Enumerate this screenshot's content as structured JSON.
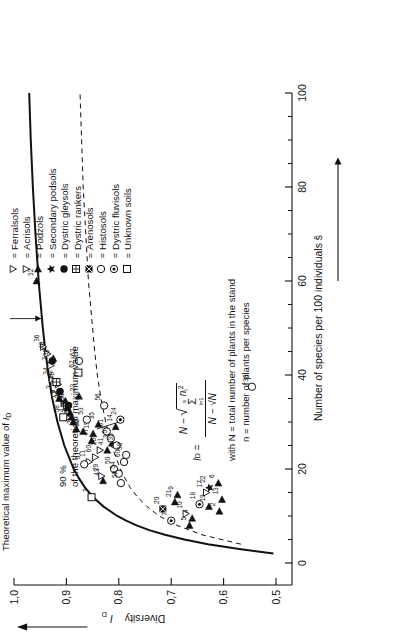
{
  "chart_data": {
    "type": "scatter",
    "title": "",
    "xlabel": "Number of species per 100 individuals  ŝ",
    "ylabel": "Diversity I_D",
    "xlim": [
      0,
      100
    ],
    "ylim": [
      0.5,
      1.0
    ],
    "x_ticks": [
      0,
      20,
      40,
      60,
      80,
      100
    ],
    "x_tick_labels": [
      "0",
      "20",
      "40",
      "60",
      "80",
      "100"
    ],
    "x_minor_ticks": [
      5,
      10,
      15,
      25,
      30,
      35,
      45,
      50,
      55,
      65,
      70,
      75,
      85,
      90,
      95
    ],
    "y_ticks": [
      0.5,
      0.6,
      0.7,
      0.8,
      0.9,
      1.0
    ],
    "y_tick_labels": [
      "0,5",
      "0,6",
      "0,7",
      "0,8",
      "0,9",
      "1,0"
    ],
    "grid": false,
    "legend_position": "right",
    "curves": [
      {
        "name": "Theoretical maximum value of ID",
        "style": "solid",
        "points": [
          [
            2,
            0.505
          ],
          [
            3,
            0.57
          ],
          [
            4,
            0.63
          ],
          [
            5,
            0.675
          ],
          [
            6,
            0.712
          ],
          [
            7,
            0.742
          ],
          [
            8,
            0.766
          ],
          [
            9,
            0.786
          ],
          [
            10,
            0.803
          ],
          [
            12,
            0.829
          ],
          [
            14,
            0.849
          ],
          [
            16,
            0.864
          ],
          [
            18,
            0.876
          ],
          [
            20,
            0.886
          ],
          [
            25,
            0.904
          ],
          [
            30,
            0.917
          ],
          [
            35,
            0.927
          ],
          [
            40,
            0.934
          ],
          [
            45,
            0.94
          ],
          [
            50,
            0.945
          ],
          [
            60,
            0.953
          ],
          [
            70,
            0.959
          ],
          [
            80,
            0.964
          ],
          [
            90,
            0.968
          ],
          [
            100,
            0.971
          ]
        ]
      },
      {
        "name": "90 % of the theoretical maximum value",
        "style": "dashed",
        "points": [
          [
            4,
            0.567
          ],
          [
            6,
            0.641
          ],
          [
            8,
            0.689
          ],
          [
            10,
            0.723
          ],
          [
            12,
            0.746
          ],
          [
            14,
            0.764
          ],
          [
            16,
            0.778
          ],
          [
            18,
            0.788
          ],
          [
            20,
            0.797
          ],
          [
            25,
            0.814
          ],
          [
            30,
            0.825
          ],
          [
            35,
            0.834
          ],
          [
            40,
            0.841
          ],
          [
            45,
            0.846
          ],
          [
            50,
            0.85
          ],
          [
            60,
            0.858
          ],
          [
            70,
            0.863
          ],
          [
            80,
            0.868
          ],
          [
            90,
            0.871
          ],
          [
            100,
            0.874
          ]
        ]
      }
    ],
    "series": [
      {
        "name": "Ferralsols",
        "symbol": "triangle-down-open",
        "values": [
          {
            "label": "36",
            "x": 46.0,
            "y": 0.944
          },
          {
            "label": "40",
            "x": 44.5,
            "y": 0.936
          },
          {
            "label": "7",
            "x": 42.0,
            "y": 0.93
          },
          {
            "label": "34",
            "x": 39.0,
            "y": 0.927
          },
          {
            "label": "3",
            "x": 36.0,
            "y": 0.922
          },
          {
            "label": "39",
            "x": 34.0,
            "y": 0.905
          },
          {
            "label": "45",
            "x": 33.5,
            "y": 0.9
          },
          {
            "label": "4",
            "x": 31.0,
            "y": 0.897
          },
          {
            "label": "11",
            "x": 21.5,
            "y": 0.857
          },
          {
            "label": "60",
            "x": 22.5,
            "y": 0.845
          },
          {
            "label": "26",
            "x": 24.0,
            "y": 0.836
          },
          {
            "label": "29",
            "x": 18.5,
            "y": 0.833
          },
          {
            "label": "10",
            "x": 10.5,
            "y": 0.672
          },
          {
            "label": "17",
            "x": 15.0,
            "y": 0.633
          }
        ]
      },
      {
        "name": "Acrisols",
        "symbol": "triangle-down-open-small",
        "values": [
          {
            "label": "48",
            "x": 38.0,
            "y": 0.916
          }
        ]
      },
      {
        "name": "Podzols",
        "symbol": "triangle-right-filled",
        "values": [
          {
            "label": "32",
            "x": 60.0,
            "y": 0.957
          },
          {
            "label": "1",
            "x": 43.5,
            "y": 0.925
          },
          {
            "label": "8",
            "x": 35.0,
            "y": 0.914
          },
          {
            "label": "46",
            "x": 34.5,
            "y": 0.902
          },
          {
            "label": "44",
            "x": 33.0,
            "y": 0.898
          },
          {
            "label": "27",
            "x": 32.0,
            "y": 0.893
          },
          {
            "label": "49",
            "x": 31.0,
            "y": 0.89
          },
          {
            "label": "25",
            "x": 30.0,
            "y": 0.887
          },
          {
            "label": "2",
            "x": 28.5,
            "y": 0.881
          },
          {
            "label": "23",
            "x": 35.5,
            "y": 0.876
          },
          {
            "label": "52",
            "x": 28.0,
            "y": 0.868
          },
          {
            "label": "47",
            "x": 26.0,
            "y": 0.852
          },
          {
            "label": "15",
            "x": 27.5,
            "y": 0.849
          },
          {
            "label": "35",
            "x": 29.5,
            "y": 0.839
          },
          {
            "label": "43",
            "x": 17.5,
            "y": 0.83
          },
          {
            "label": "41",
            "x": 24.0,
            "y": 0.822
          },
          {
            "label": "31",
            "x": 25.5,
            "y": 0.813
          },
          {
            "label": "14",
            "x": 29.0,
            "y": 0.806
          },
          {
            "label": "21",
            "x": 13.0,
            "y": 0.693
          },
          {
            "label": "9",
            "x": 14.5,
            "y": 0.688
          },
          {
            "label": "5",
            "x": 8.0,
            "y": 0.665
          },
          {
            "label": "4",
            "x": 9.5,
            "y": 0.66
          },
          {
            "label": "19",
            "x": 12.0,
            "y": 0.628
          },
          {
            "label": "2",
            "x": 11.0,
            "y": 0.608
          },
          {
            "label": "13",
            "x": 13.5,
            "y": 0.603
          },
          {
            "label": "6",
            "x": 17.0,
            "y": 0.61
          }
        ]
      },
      {
        "name": "Secondary podsols",
        "symbol": "star-filled",
        "values": [
          {
            "label": "22",
            "x": 16.0,
            "y": 0.627
          }
        ]
      },
      {
        "name": "Dystric gleysols",
        "symbol": "circle-filled",
        "values": [
          {
            "label": "37",
            "x": 43.0,
            "y": 0.927
          },
          {
            "label": "28",
            "x": 36.5,
            "y": 0.912
          },
          {
            "label": "30",
            "x": 33.5,
            "y": 0.896
          }
        ]
      },
      {
        "name": "Dystric rankers",
        "symbol": "square-grid",
        "values": [
          {
            "label": "42",
            "x": 38.5,
            "y": 0.919
          }
        ]
      },
      {
        "name": "Arenosols",
        "symbol": "square-hatched",
        "values": [
          {
            "label": "20",
            "x": 11.5,
            "y": 0.716
          }
        ]
      },
      {
        "name": "Histosols",
        "symbol": "circle-open",
        "values": [
          {
            "label": "51",
            "x": 21.0,
            "y": 0.866
          },
          {
            "label": "53",
            "x": 30.5,
            "y": 0.861
          },
          {
            "label": "56",
            "x": 33.5,
            "y": 0.828
          },
          {
            "label": "61",
            "x": 28.0,
            "y": 0.823
          },
          {
            "label": "57",
            "x": 26.5,
            "y": 0.815
          },
          {
            "label": "50",
            "x": 20.0,
            "y": 0.809
          },
          {
            "label": "33",
            "x": 25.0,
            "y": 0.804
          },
          {
            "label": "54",
            "x": 19.0,
            "y": 0.8
          },
          {
            "label": "59",
            "x": 17.0,
            "y": 0.796
          },
          {
            "label": "60",
            "x": 21.5,
            "y": 0.79
          },
          {
            "label": "58",
            "x": 23.0,
            "y": 0.786
          },
          {
            "label": "62",
            "x": 43.0,
            "y": 0.876
          },
          {
            "label": "38",
            "x": 37.5,
            "y": 0.546
          }
        ]
      },
      {
        "name": "Dystric fluvisols",
        "symbol": "circle-dot",
        "values": [
          {
            "label": "24",
            "x": 30.5,
            "y": 0.797
          },
          {
            "label": "7",
            "x": 9.0,
            "y": 0.7
          },
          {
            "label": "18",
            "x": 12.5,
            "y": 0.646
          }
        ]
      },
      {
        "name": "Unknown soils",
        "symbol": "square-open",
        "values": [
          {
            "label": "58",
            "x": 31.0,
            "y": 0.906
          },
          {
            "label": "62",
            "x": 40.5,
            "y": 0.877
          },
          {
            "label": "7",
            "x": 14.0,
            "y": 0.852
          }
        ]
      }
    ]
  },
  "axes": {
    "x_title": "Number of species per 100 individuals",
    "x_title_symbol": "ŝ",
    "y_title": "Diversity",
    "y_title_symbol": "I",
    "y_title_sub": "D",
    "x_tick_labels": [
      "0",
      "20",
      "40",
      "60",
      "80",
      "100"
    ],
    "y_tick_labels": [
      "1,0",
      "0,9",
      "0,8",
      "0,7",
      "0,6",
      "0,5"
    ]
  },
  "annotations": {
    "max_curve_label": "Theoretical maximum value of",
    "max_curve_symbol": "I",
    "max_curve_sub": "D",
    "ninety_line_1": "90 %",
    "ninety_line_2": "of the theoretical maximum value"
  },
  "formula": {
    "lhs": "I",
    "lhs_sub": "D",
    "equals": "=",
    "numerator_lead": "N −",
    "sigma_top": "s",
    "sigma_bottom": "i=1",
    "sigma_term": "n",
    "sigma_term_sub": "i",
    "sigma_term_sup": "2",
    "denominator": "N − √N",
    "with_line_1": "with N = total number of plants in the stand",
    "with_line_2": "n = number of plants per species"
  },
  "legend": {
    "entries": [
      {
        "symbol": "triangle-down-open",
        "eq": "=",
        "label": "Ferralsols"
      },
      {
        "symbol": "triangle-down-open",
        "eq": "=",
        "label": "Acrisols"
      },
      {
        "symbol": "triangle-right-filled",
        "eq": "=",
        "label": "Podzols"
      },
      {
        "symbol": "star-filled",
        "eq": "=",
        "label": "Secondary podsols"
      },
      {
        "symbol": "circle-filled",
        "eq": "=",
        "label": "Dystric gleysols"
      },
      {
        "symbol": "square-grid",
        "eq": "=",
        "label": "Dystric rankers"
      },
      {
        "symbol": "square-hatched",
        "eq": "=",
        "label": "Arenosols"
      },
      {
        "symbol": "circle-open",
        "eq": "=",
        "label": "Histosols"
      },
      {
        "symbol": "circle-dot",
        "eq": "=",
        "label": "Dystric fluvisols"
      },
      {
        "symbol": "square-open",
        "eq": "=",
        "label": "Unknown soils"
      }
    ]
  },
  "colors": {
    "ink": "#111111",
    "background": "#ffffff"
  }
}
